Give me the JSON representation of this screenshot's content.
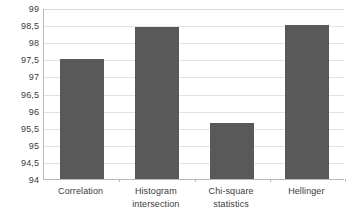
{
  "chart_data": {
    "type": "bar",
    "title": "",
    "xlabel": "",
    "ylabel": "",
    "ylim": [
      94,
      99
    ],
    "grid": true,
    "legend": "none",
    "decimal_separator": ",",
    "bar_color": "#595959",
    "gridline_color": "#e3e3e3",
    "axis_color": "#b8b8b8",
    "categories": [
      "Correlation",
      "Histogram intersection",
      "Chi-square statistics",
      "Hellinger"
    ],
    "category_label_lines": [
      [
        "Correlation",
        ""
      ],
      [
        "Histogram",
        "intersection"
      ],
      [
        "Chi-square",
        "statistics"
      ],
      [
        "Hellinger",
        ""
      ]
    ],
    "values": [
      97.5,
      98.44,
      95.65,
      98.5
    ],
    "ytick_values": [
      99,
      98.5,
      98,
      97.5,
      97,
      96.5,
      96,
      95.5,
      95,
      94.5,
      94
    ],
    "ytick_labels": [
      "99",
      "98,5",
      "98",
      "97,5",
      "97",
      "96,5",
      "96",
      "95,5",
      "95",
      "94,5",
      "94"
    ]
  }
}
